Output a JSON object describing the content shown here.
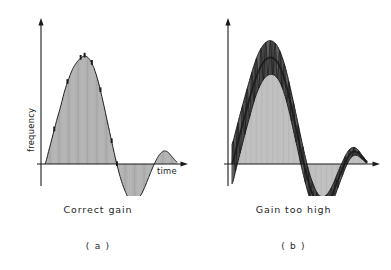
{
  "figure": {
    "background_color": "#ffffff",
    "ink_color": "#1a1a1a"
  },
  "panels": [
    {
      "id": "a",
      "index_label": "( a )",
      "caption": "Correct gain",
      "y_axis_label": "frequency",
      "x_axis_label": "time",
      "axis": {
        "origin_x": 41,
        "origin_y": 164,
        "y_arrow_tip_y": 18,
        "x_arrow_tip_x": 188
      }
    },
    {
      "id": "b",
      "index_label": "( b )",
      "caption": "Gain too high",
      "y_axis_label": "frequency",
      "x_axis_label": "time",
      "axis": {
        "origin_x": 32,
        "origin_y": 164,
        "y_arrow_tip_y": 18,
        "x_arrow_tip_x": 184
      }
    }
  ],
  "chart_data": [
    {
      "type": "line",
      "title": "Correct gain",
      "xlabel": "time",
      "ylabel": "frequency",
      "panel": "a",
      "grid": false,
      "legend": "none",
      "xlim": [
        0,
        1
      ],
      "ylim": [
        -0.45,
        1.0
      ],
      "annotation": "Damped step response: single overshoot then small undershoot and a small second overshoot, settling to zero. Curve drawn as dense vertical hatch fill between the curve and the time axis.",
      "series": [
        {
          "name": "correct gain response",
          "description": "decaying oscillation, damping strong",
          "x": [
            0.0,
            0.03,
            0.06,
            0.09,
            0.12,
            0.15,
            0.18,
            0.21,
            0.24,
            0.27,
            0.3,
            0.33,
            0.36,
            0.39,
            0.42,
            0.45,
            0.48,
            0.51,
            0.54,
            0.57,
            0.6,
            0.63,
            0.66,
            0.69,
            0.72,
            0.75,
            0.78,
            0.81,
            0.84,
            0.87,
            0.9,
            0.93,
            0.96,
            1.0
          ],
          "y": [
            0.0,
            0.13,
            0.27,
            0.41,
            0.54,
            0.68,
            0.79,
            0.88,
            0.94,
            0.98,
            1.0,
            0.98,
            0.92,
            0.82,
            0.68,
            0.52,
            0.35,
            0.18,
            0.02,
            -0.12,
            -0.23,
            -0.31,
            -0.35,
            -0.34,
            -0.3,
            -0.23,
            -0.14,
            -0.05,
            0.03,
            0.09,
            0.12,
            0.11,
            0.07,
            0.02
          ]
        }
      ]
    },
    {
      "type": "line",
      "title": "Gain too high",
      "xlabel": "time",
      "ylabel": "frequency",
      "panel": "b",
      "grid": false,
      "legend": "none",
      "xlim": [
        0,
        1
      ],
      "ylim": [
        -0.55,
        1.15
      ],
      "annotation": "Over-damped-gain step response: same mean trajectory as (a) but with a large superimposed high-frequency oscillation (hunting). Drawn as a thick dark oscillating band with hatch fill to the time axis.",
      "series": [
        {
          "name": "mean response",
          "description": "underlying trajectory about which the hunting oscillation occurs",
          "x": [
            0.0,
            0.03,
            0.06,
            0.09,
            0.12,
            0.15,
            0.18,
            0.21,
            0.24,
            0.27,
            0.3,
            0.33,
            0.36,
            0.39,
            0.42,
            0.45,
            0.48,
            0.51,
            0.54,
            0.57,
            0.6,
            0.63,
            0.66,
            0.69,
            0.72,
            0.75,
            0.78,
            0.81,
            0.84,
            0.87,
            0.9,
            0.93,
            0.96,
            1.0
          ],
          "y": [
            0.0,
            0.14,
            0.29,
            0.44,
            0.58,
            0.72,
            0.84,
            0.93,
            0.99,
            1.02,
            1.02,
            0.99,
            0.92,
            0.81,
            0.66,
            0.49,
            0.31,
            0.13,
            -0.04,
            -0.19,
            -0.3,
            -0.38,
            -0.41,
            -0.4,
            -0.35,
            -0.27,
            -0.17,
            -0.07,
            0.02,
            0.09,
            0.12,
            0.11,
            0.07,
            0.02
          ]
        },
        {
          "name": "hunting amplitude envelope",
          "description": "half-amplitude of superimposed oscillation, decaying with time",
          "x": [
            0.0,
            0.1,
            0.2,
            0.3,
            0.4,
            0.5,
            0.6,
            0.7,
            0.8,
            0.9,
            1.0
          ],
          "y": [
            0.19,
            0.18,
            0.17,
            0.16,
            0.14,
            0.13,
            0.11,
            0.09,
            0.07,
            0.04,
            0.01
          ]
        }
      ]
    }
  ]
}
